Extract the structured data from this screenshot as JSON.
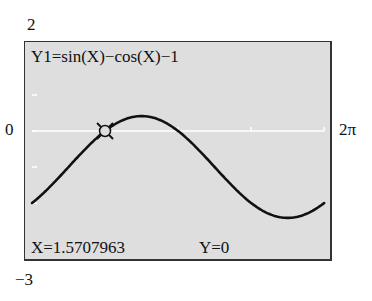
{
  "window": {
    "ymax_label": "2",
    "ymin_label": "−3",
    "xmin_label": "0",
    "xmax_label": "2π"
  },
  "screen": {
    "function_label": "Y1=sin(X)−cos(X)−1",
    "cursor_x_label": "X=1.5707963",
    "cursor_y_label": "Y=0",
    "background_color": "#dedede",
    "curve_color": "#111111",
    "axis_color": "#ffffff"
  },
  "chart_data": {
    "type": "line",
    "title": "Y1=sin(X)−cos(X)−1",
    "xlabel": "",
    "ylabel": "",
    "xlim": [
      0,
      6.2832
    ],
    "ylim": [
      -3,
      2
    ],
    "x_tick_labels": [
      "0",
      "2π"
    ],
    "y_tick_labels": [
      "2",
      "−3"
    ],
    "grid": false,
    "series": [
      {
        "name": "Y1",
        "x": [
          0,
          0.3927,
          0.7854,
          1.1781,
          1.5708,
          1.9635,
          2.3562,
          2.7489,
          3.1416,
          3.5343,
          3.927,
          4.3197,
          4.7124,
          5.1051,
          5.4978,
          5.8905,
          6.2832
        ],
        "values": [
          -2.0,
          -1.541,
          -1.0,
          -0.459,
          0.0,
          0.307,
          0.414,
          0.307,
          0.0,
          -0.459,
          -1.0,
          -1.541,
          -2.0,
          -2.307,
          -2.414,
          -2.307,
          -2.0
        ]
      }
    ],
    "annotations": [
      {
        "type": "trace-cursor",
        "x": 1.5707963,
        "y": 0,
        "label": "X=1.5707963  Y=0"
      }
    ]
  }
}
